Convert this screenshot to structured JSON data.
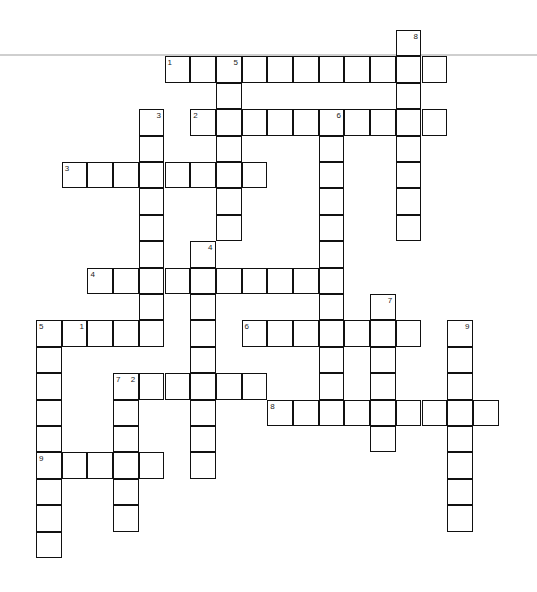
{
  "puzzle": {
    "grid": {
      "origin_x": 36,
      "origin_y": 30,
      "cell_w": 25.7,
      "cell_h": 26.4
    },
    "across": [
      {
        "number": "1",
        "row": 1,
        "col": 5,
        "length": 11
      },
      {
        "number": "2",
        "row": 3,
        "col": 6,
        "length": 10
      },
      {
        "number": "3",
        "row": 5,
        "col": 1,
        "length": 8
      },
      {
        "number": "4",
        "row": 9,
        "col": 2,
        "length": 10
      },
      {
        "number": "5",
        "row": 11,
        "col": 0,
        "length": 5
      },
      {
        "number": "6",
        "row": 11,
        "col": 8,
        "length": 7
      },
      {
        "number": "7",
        "row": 13,
        "col": 3,
        "length": 6
      },
      {
        "number": "8",
        "row": 14,
        "col": 9,
        "length": 9
      },
      {
        "number": "9",
        "row": 16,
        "col": 0,
        "length": 5
      }
    ],
    "down": [
      {
        "number": "1",
        "row": 11,
        "col": 1,
        "length": 1
      },
      {
        "number": "2",
        "row": 13,
        "col": 3,
        "length": 6
      },
      {
        "number": "3",
        "row": 3,
        "col": 4,
        "length": 8
      },
      {
        "number": "4",
        "row": 8,
        "col": 6,
        "length": 9
      },
      {
        "number": "5",
        "row": 1,
        "col": 7,
        "length": 7
      },
      {
        "number": "6",
        "row": 3,
        "col": 11,
        "length": 11
      },
      {
        "number": "7",
        "row": 10,
        "col": 13,
        "length": 6
      },
      {
        "number": "8",
        "row": 0,
        "col": 14,
        "length": 8
      },
      {
        "number": "9",
        "row": 11,
        "col": 16,
        "length": 8
      }
    ],
    "down_extra": [
      {
        "number": "5",
        "row": 11,
        "col": 0,
        "length": 9
      }
    ]
  }
}
